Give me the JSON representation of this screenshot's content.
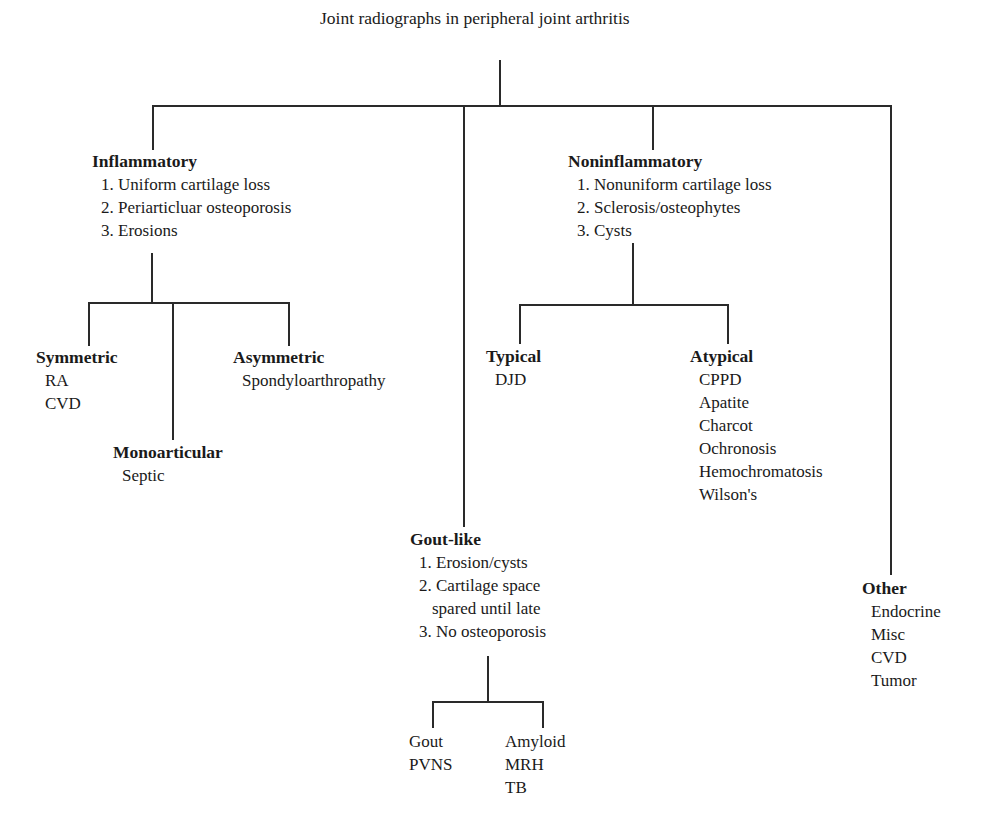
{
  "root": {
    "title": "Joint radiographs in peripheral joint arthritis"
  },
  "inflammatory": {
    "title": "Inflammatory",
    "criteria": [
      "1. Uniform cartilage loss",
      "2. Periarticluar osteoporosis",
      "3. Erosions"
    ],
    "symmetric": {
      "title": "Symmetric",
      "items": [
        "RA",
        "CVD"
      ]
    },
    "asymmetric": {
      "title": "Asymmetric",
      "items": [
        "Spondyloarthropathy"
      ]
    },
    "monoarticular": {
      "title": "Monoarticular",
      "items": [
        "Septic"
      ]
    }
  },
  "noninflammatory": {
    "title": "Noninflammatory",
    "criteria": [
      "1. Nonuniform cartilage loss",
      "2. Sclerosis/osteophytes",
      "3. Cysts"
    ],
    "typical": {
      "title": "Typical",
      "items": [
        "DJD"
      ]
    },
    "atypical": {
      "title": "Atypical",
      "items": [
        "CPPD",
        "Apatite",
        "Charcot",
        "Ochronosis",
        "Hemochromatosis",
        "Wilson's"
      ]
    }
  },
  "goutlike": {
    "title": "Gout-like",
    "criteria": [
      "1. Erosion/cysts",
      "2. Cartilage space",
      "spared until late",
      "3. No osteoporosis"
    ],
    "left": {
      "items": [
        "Gout",
        "PVNS"
      ]
    },
    "right": {
      "items": [
        "Amyloid",
        "MRH",
        "TB"
      ]
    }
  },
  "other": {
    "title": "Other",
    "items": [
      "Endocrine",
      "Misc",
      "CVD",
      "Tumor"
    ]
  }
}
